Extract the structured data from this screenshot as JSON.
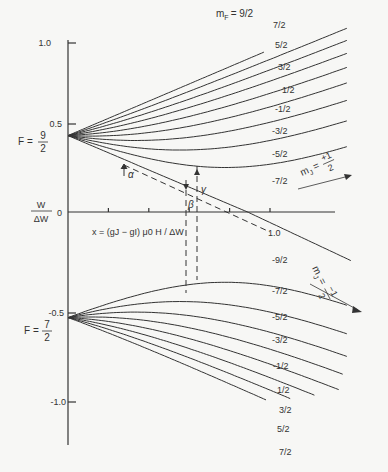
{
  "chart_data": {
    "type": "line",
    "xlabel": "x = (g_J - g_I) μ0 H / ΔW",
    "ylabel": "W / ΔW",
    "xlim": [
      0,
      1.3
    ],
    "ylim": [
      -1.2,
      1.1
    ],
    "y_ticks": [
      "1.0",
      "0.5",
      "0",
      "-0.5",
      "-1.0"
    ],
    "x_ticks": [
      0.2,
      0.4,
      0.6,
      0.8,
      1.0
    ],
    "x_tick_labels": [
      "1.0"
    ],
    "groups": [
      {
        "name": "F = 9/2",
        "W_at_zero": 0.444,
        "mF": [
          "9/2",
          "7/2",
          "5/2",
          "3/2",
          "1/2",
          "-1/2",
          "-3/2",
          "-5/2",
          "-7/2",
          "-9/2"
        ]
      },
      {
        "name": "F = 7/2",
        "W_at_zero": -0.556,
        "mF": [
          "-7/2",
          "-5/2",
          "-3/2",
          "-1/2",
          "1/2",
          "3/2",
          "5/2",
          "7/2"
        ]
      }
    ],
    "annotations": [
      "α",
      "β",
      "γ",
      "m_J = +1/2",
      "m_J = -1/2",
      "m_F = 9/2"
    ]
  },
  "labels": {
    "y_axis_label_num": "W",
    "y_axis_label_den": "ΔW",
    "x_axis_label": "x = (g",
    "x_axis_label_full": "x = (gJ − gI) μ0 H / ΔW",
    "f_upper": "F =",
    "f_upper_num": "9",
    "f_upper_den": "2",
    "f_lower": "F =",
    "f_lower_num": "7",
    "f_lower_den": "2",
    "mf_title": "m",
    "mf_sub": "F",
    "mf_title_value": "= 9/2",
    "mj_plus": "m",
    "mj_plus_sub": "J",
    "mj_plus_val_num": "+1",
    "mj_plus_val_den": "2",
    "mj_minus_val_num": "−1",
    "mj_minus_val_den": "2",
    "alpha": "α",
    "beta": "β",
    "gamma": "γ",
    "tick_10": "1.0",
    "tick_05": "0.5",
    "tick_0": "0",
    "tick_m05": "-0.5",
    "tick_m10": "-1.0",
    "x_tick_10": "1.0"
  },
  "upper_labels": [
    "7/2",
    "5/2",
    "3/2",
    "1/2",
    "-1/2",
    "-3/2",
    "-5/2",
    "-7/2"
  ],
  "lower_labels": [
    "-9/2",
    "-7/2",
    "-5/2",
    "-3/2",
    "-1/2",
    "1/2",
    "3/2",
    "5/2",
    "7/2"
  ]
}
